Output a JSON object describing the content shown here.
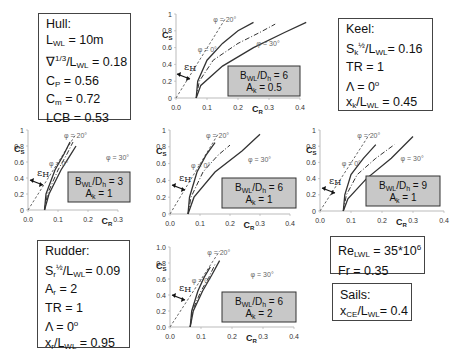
{
  "hull": {
    "title": "Hull:",
    "lines": [
      "L_WL = 10m",
      "∇^1/3/L_WL = 0.18",
      "C_P = 0.56",
      "C_m = 0.72",
      "LCB = 0.53"
    ],
    "lwl": "10m",
    "vol": "0.18",
    "cp": "0.56",
    "cm": "0.72",
    "lcb": "0.53"
  },
  "keel": {
    "title": "Keel:",
    "sk": "0.16",
    "tr": "1",
    "lambda": "0",
    "xk": "0.45"
  },
  "rudder": {
    "title": "Rudder:",
    "sr": "0.09",
    "ar": "2",
    "tr": "1",
    "lambda": "0",
    "xr": "0.95"
  },
  "flow": {
    "re": "35*10",
    "re_exp": "6",
    "fr": "0.35"
  },
  "sails": {
    "title": "Sails:",
    "xce": "0.4"
  },
  "chart_data": [
    {
      "type": "line",
      "id": "top-middle",
      "bwl_dh": "6",
      "ak": "0.5",
      "xlabel": "C_R",
      "ylabel": "C_S",
      "xlim": [
        0,
        0.4
      ],
      "ylim": [
        0,
        1
      ],
      "xticks": [
        "0.0",
        "0.1",
        "0.2",
        "0.3",
        "0.4"
      ],
      "yticks": [
        "0",
        "0.2",
        "0.4",
        "0.6",
        "0.8",
        "1"
      ],
      "series": [
        {
          "name": "φ = 0°",
          "style": "solid",
          "x": [
            0.065,
            0.07,
            0.1,
            0.15,
            0.2,
            0.25
          ],
          "y": [
            0,
            0.2,
            0.45,
            0.65,
            0.8,
            0.9
          ]
        },
        {
          "name": "φ = 20°",
          "style": "dashdot",
          "x": [
            0.065,
            0.075,
            0.12,
            0.2,
            0.27,
            0.32
          ],
          "y": [
            0,
            0.2,
            0.45,
            0.65,
            0.78,
            0.88
          ]
        },
        {
          "name": "φ = 30°",
          "style": "solid",
          "x": [
            0.065,
            0.08,
            0.15,
            0.25,
            0.35,
            0.42
          ],
          "y": [
            0,
            0.15,
            0.38,
            0.6,
            0.78,
            0.9
          ]
        }
      ],
      "annotation": "ε_H"
    },
    {
      "type": "line",
      "id": "middle-left",
      "bwl_dh": "3",
      "ak": "1",
      "xlabel": "C_R",
      "ylabel": "C_S",
      "xlim": [
        0,
        0.3
      ],
      "ylim": [
        0,
        1
      ],
      "xticks": [
        "0.0",
        "0.1",
        "0.2",
        "0.3"
      ],
      "yticks": [
        "0",
        "0.2",
        "0.4",
        "0.6",
        "0.8",
        "1"
      ],
      "series": [
        {
          "name": "φ = 0°",
          "style": "solid",
          "x": [
            0.055,
            0.06,
            0.09,
            0.12,
            0.14
          ],
          "y": [
            0,
            0.2,
            0.5,
            0.7,
            0.85
          ]
        },
        {
          "name": "φ = 20°",
          "style": "dashdot",
          "x": [
            0.055,
            0.065,
            0.1,
            0.13,
            0.15
          ],
          "y": [
            0,
            0.2,
            0.5,
            0.7,
            0.85
          ]
        },
        {
          "name": "φ = 30°",
          "style": "solid",
          "x": [
            0.055,
            0.07,
            0.11,
            0.14,
            0.16
          ],
          "y": [
            0,
            0.2,
            0.5,
            0.68,
            0.8
          ]
        }
      ],
      "annotation": "ε_H"
    },
    {
      "type": "line",
      "id": "middle-center",
      "bwl_dh": "6",
      "ak": "1",
      "xlabel": "C_R",
      "ylabel": "C_S",
      "xlim": [
        0,
        0.4
      ],
      "ylim": [
        0,
        1
      ],
      "xticks": [
        "0.0",
        "0.1",
        "0.2",
        "0.3",
        "0.4"
      ],
      "yticks": [
        "0",
        "0.2",
        "0.4",
        "0.6",
        "0.8",
        "1"
      ],
      "series": [
        {
          "name": "φ = 0°",
          "style": "solid",
          "x": [
            0.06,
            0.065,
            0.09,
            0.12,
            0.15
          ],
          "y": [
            0,
            0.2,
            0.5,
            0.7,
            0.85
          ]
        },
        {
          "name": "φ = 20°",
          "style": "dashdot",
          "x": [
            0.06,
            0.07,
            0.11,
            0.16,
            0.2
          ],
          "y": [
            0,
            0.2,
            0.5,
            0.7,
            0.82
          ]
        },
        {
          "name": "φ = 30°",
          "style": "solid",
          "x": [
            0.06,
            0.08,
            0.15,
            0.24,
            0.3
          ],
          "y": [
            0,
            0.2,
            0.5,
            0.75,
            0.95
          ]
        }
      ],
      "annotation": "ε_H"
    },
    {
      "type": "line",
      "id": "middle-right",
      "bwl_dh": "9",
      "ak": "1",
      "xlabel": "C_R",
      "ylabel": "C_S",
      "xlim": [
        0,
        0.4
      ],
      "ylim": [
        0,
        1
      ],
      "xticks": [
        "0.0",
        "0.1",
        "0.2",
        "0.3",
        "0.4"
      ],
      "yticks": [
        "0",
        "0.2",
        "0.4",
        "0.6",
        "0.8",
        "1"
      ],
      "series": [
        {
          "name": "φ = 0°",
          "style": "solid",
          "x": [
            0.075,
            0.08,
            0.1,
            0.14,
            0.18
          ],
          "y": [
            0,
            0.2,
            0.45,
            0.65,
            0.82
          ]
        },
        {
          "name": "φ = 20°",
          "style": "dashdot",
          "x": [
            0.075,
            0.085,
            0.12,
            0.18,
            0.24
          ],
          "y": [
            0,
            0.2,
            0.45,
            0.65,
            0.82
          ]
        },
        {
          "name": "φ = 30°",
          "style": "solid",
          "x": [
            0.075,
            0.09,
            0.15,
            0.23,
            0.3
          ],
          "y": [
            0,
            0.15,
            0.4,
            0.65,
            0.92
          ]
        }
      ],
      "annotation": "ε_H"
    },
    {
      "type": "line",
      "id": "bottom-middle",
      "bwl_dh": "6",
      "ak": "2",
      "xlabel": "C_R",
      "ylabel": "C_S",
      "xlim": [
        0,
        0.4
      ],
      "ylim": [
        0,
        1
      ],
      "xticks": [
        "0.0",
        "0.1",
        "0.2",
        "0.3",
        "0.4"
      ],
      "yticks": [
        "0.0",
        "0.2",
        "0.4",
        "0.6",
        "0.8",
        "1.0"
      ],
      "series": [
        {
          "name": "φ = 0°",
          "style": "solid",
          "x": [
            0.065,
            0.07,
            0.09,
            0.11,
            0.13
          ],
          "y": [
            0,
            0.2,
            0.45,
            0.62,
            0.75
          ]
        },
        {
          "name": "φ = 20°",
          "style": "dashdot",
          "x": [
            0.065,
            0.072,
            0.1,
            0.125,
            0.145
          ],
          "y": [
            0,
            0.2,
            0.45,
            0.62,
            0.78
          ]
        },
        {
          "name": "φ = 30°",
          "style": "solid",
          "x": [
            0.065,
            0.075,
            0.105,
            0.135,
            0.16
          ],
          "y": [
            0,
            0.2,
            0.45,
            0.65,
            0.83
          ]
        }
      ],
      "annotation": "ε_H"
    }
  ],
  "labels": {
    "phi0": "φ = 0°",
    "phi20": "φ = 20°",
    "phi30": "φ = 30°",
    "eps": "ε",
    "eps_sub": "H",
    "cs": "C",
    "cs_sub": "S",
    "cr": "C",
    "cr_sub": "R",
    "bwl": "B",
    "bwl_sub": "WL",
    "dh": "/D",
    "dh_sub": "h",
    "ak": "A",
    "ak_sub": "k"
  }
}
